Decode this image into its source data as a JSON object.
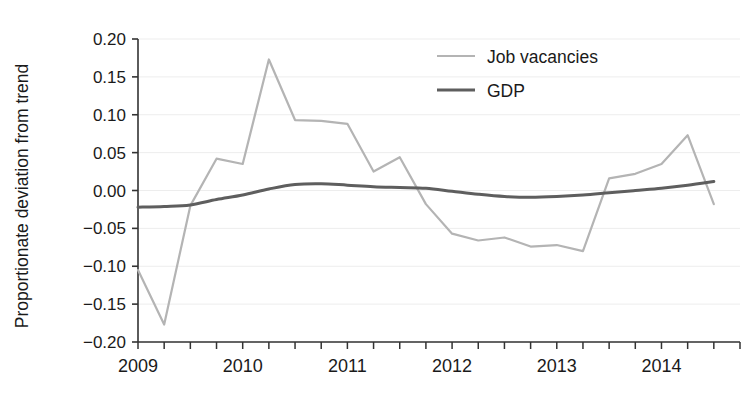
{
  "chart_data": {
    "type": "line",
    "title": "",
    "xlabel": "",
    "ylabel": "Proportionate deviation from trend",
    "ylim": [
      -0.2,
      0.2
    ],
    "xlim": [
      2009.0,
      2014.75
    ],
    "grid": true,
    "grid_axis": "y",
    "legend_position": "top-right",
    "yticks": [
      "0.20",
      "0.15",
      "0.10",
      "0.05",
      "0.00",
      "−0.05",
      "−0.10",
      "−0.15",
      "−0.20"
    ],
    "ytick_values": [
      0.2,
      0.15,
      0.1,
      0.05,
      0.0,
      -0.05,
      -0.1,
      -0.15,
      -0.2
    ],
    "xticks": [
      "2009",
      "2010",
      "2011",
      "2012",
      "2013",
      "2014"
    ],
    "xtick_values": [
      2009,
      2010,
      2011,
      2012,
      2013,
      2014
    ],
    "x_minor_step": 0.25,
    "x": [
      2009.0,
      2009.25,
      2009.5,
      2009.75,
      2010.0,
      2010.25,
      2010.5,
      2010.75,
      2011.0,
      2011.25,
      2011.5,
      2011.75,
      2012.0,
      2012.25,
      2012.5,
      2012.75,
      2013.0,
      2013.25,
      2013.5,
      2013.75,
      2014.0,
      2014.25,
      2014.5
    ],
    "series": [
      {
        "name": "Job vacancies",
        "color": "#b4b4b4",
        "width": 2.2,
        "values": [
          -0.105,
          -0.177,
          -0.02,
          0.042,
          0.035,
          0.173,
          0.093,
          0.092,
          0.088,
          0.025,
          0.044,
          -0.018,
          -0.057,
          -0.066,
          -0.062,
          -0.074,
          -0.072,
          -0.08,
          0.016,
          0.022,
          0.035,
          0.073,
          -0.018
        ]
      },
      {
        "name": "GDP",
        "color": "#5e5e5e",
        "width": 3.0,
        "values": [
          -0.022,
          -0.021,
          -0.019,
          -0.012,
          -0.006,
          0.002,
          0.008,
          0.009,
          0.007,
          0.005,
          0.004,
          0.003,
          -0.001,
          -0.005,
          -0.008,
          -0.009,
          -0.008,
          -0.006,
          -0.003,
          0.0,
          0.003,
          0.007,
          0.012
        ]
      }
    ]
  },
  "legend": {
    "items": [
      {
        "label": "Job vacancies",
        "color": "#b4b4b4"
      },
      {
        "label": "GDP",
        "color": "#5e5e5e"
      }
    ]
  },
  "axes": {
    "y_title": "Proportionate deviation from trend",
    "axis_color": "#333333",
    "grid_color": "#ededed"
  }
}
